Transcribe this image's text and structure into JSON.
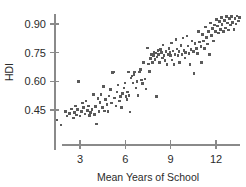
{
  "chart_data": {
    "type": "scatter",
    "title": "",
    "xlabel": "Mean Years of School",
    "ylabel": "HDI",
    "xlim": [
      1.1,
      13.6
    ],
    "ylim": [
      0.345,
      0.975
    ],
    "grid": false,
    "legend": null,
    "xticks": [
      3,
      6,
      9,
      12
    ],
    "xtick_labels": [
      "3",
      "6",
      "9",
      "12"
    ],
    "yticks": [
      0.45,
      0.6,
      0.75,
      0.9
    ],
    "ytick_labels": [
      "0.45",
      "0.60",
      "0.75",
      "0.90"
    ],
    "marker": {
      "shape": "square",
      "size_px": 2.6,
      "color": "#5a5a5a"
    },
    "series": [
      {
        "name": "countries",
        "n_points": 168,
        "points": [
          [
            1.45,
            0.398
          ],
          [
            1.75,
            0.372
          ],
          [
            2.05,
            0.443
          ],
          [
            2.15,
            0.418
          ],
          [
            2.3,
            0.432
          ],
          [
            2.45,
            0.455
          ],
          [
            2.55,
            0.408
          ],
          [
            2.62,
            0.438
          ],
          [
            2.7,
            0.47
          ],
          [
            2.78,
            0.424
          ],
          [
            2.85,
            0.452
          ],
          [
            2.92,
            0.6
          ],
          [
            3.0,
            0.418
          ],
          [
            3.1,
            0.441
          ],
          [
            3.18,
            0.486
          ],
          [
            3.25,
            0.462
          ],
          [
            3.32,
            0.43
          ],
          [
            3.4,
            0.497
          ],
          [
            3.48,
            0.448
          ],
          [
            3.55,
            0.47
          ],
          [
            3.62,
            0.422
          ],
          [
            3.7,
            0.437
          ],
          [
            3.8,
            0.452
          ],
          [
            3.88,
            0.53
          ],
          [
            3.95,
            0.425
          ],
          [
            4.02,
            0.468
          ],
          [
            4.1,
            0.376
          ],
          [
            4.18,
            0.51
          ],
          [
            4.25,
            0.443
          ],
          [
            4.32,
            0.489
          ],
          [
            4.4,
            0.53
          ],
          [
            4.48,
            0.462
          ],
          [
            4.55,
            0.572
          ],
          [
            4.62,
            0.445
          ],
          [
            4.7,
            0.505
          ],
          [
            4.78,
            0.478
          ],
          [
            4.85,
            0.441
          ],
          [
            4.92,
            0.523
          ],
          [
            5.0,
            0.556
          ],
          [
            5.08,
            0.487
          ],
          [
            5.15,
            0.645
          ],
          [
            5.22,
            0.648
          ],
          [
            5.3,
            0.512
          ],
          [
            5.38,
            0.47
          ],
          [
            5.45,
            0.545
          ],
          [
            5.52,
            0.58
          ],
          [
            5.6,
            0.497
          ],
          [
            5.68,
            0.521
          ],
          [
            5.75,
            0.462
          ],
          [
            5.82,
            0.535
          ],
          [
            5.9,
            0.566
          ],
          [
            5.98,
            0.592
          ],
          [
            6.05,
            0.52
          ],
          [
            6.1,
            0.505
          ],
          [
            6.15,
            0.545
          ],
          [
            6.2,
            0.648
          ],
          [
            6.25,
            0.527
          ],
          [
            6.3,
            0.44
          ],
          [
            6.38,
            0.618
          ],
          [
            6.45,
            0.628
          ],
          [
            6.52,
            0.592
          ],
          [
            6.58,
            0.636
          ],
          [
            6.62,
            0.648
          ],
          [
            6.7,
            0.565
          ],
          [
            6.78,
            0.6
          ],
          [
            6.85,
            0.525
          ],
          [
            6.92,
            0.648
          ],
          [
            7.0,
            0.662
          ],
          [
            7.08,
            0.608
          ],
          [
            7.15,
            0.588
          ],
          [
            7.22,
            0.7
          ],
          [
            7.3,
            0.612
          ],
          [
            7.38,
            0.56
          ],
          [
            7.45,
            0.775
          ],
          [
            7.52,
            0.69
          ],
          [
            7.58,
            0.652
          ],
          [
            7.65,
            0.718
          ],
          [
            7.72,
            0.742
          ],
          [
            7.8,
            0.7
          ],
          [
            7.85,
            0.735
          ],
          [
            7.9,
            0.752
          ],
          [
            7.95,
            0.715
          ],
          [
            8.0,
            0.748
          ],
          [
            8.05,
            0.52
          ],
          [
            8.1,
            0.728
          ],
          [
            8.15,
            0.76
          ],
          [
            8.2,
            0.742
          ],
          [
            8.25,
            0.7
          ],
          [
            8.32,
            0.768
          ],
          [
            8.38,
            0.752
          ],
          [
            8.45,
            0.722
          ],
          [
            8.5,
            0.79
          ],
          [
            8.55,
            0.735
          ],
          [
            8.62,
            0.71
          ],
          [
            8.68,
            0.755
          ],
          [
            8.75,
            0.688
          ],
          [
            8.82,
            0.742
          ],
          [
            8.88,
            0.772
          ],
          [
            8.95,
            0.752
          ],
          [
            9.0,
            0.735
          ],
          [
            9.05,
            0.8
          ],
          [
            9.1,
            0.712
          ],
          [
            9.15,
            0.758
          ],
          [
            9.22,
            0.688
          ],
          [
            9.28,
            0.742
          ],
          [
            9.35,
            0.82
          ],
          [
            9.42,
            0.77
          ],
          [
            9.48,
            0.735
          ],
          [
            9.55,
            0.755
          ],
          [
            9.6,
            0.7
          ],
          [
            9.68,
            0.788
          ],
          [
            9.75,
            0.742
          ],
          [
            9.82,
            0.826
          ],
          [
            9.88,
            0.762
          ],
          [
            9.95,
            0.722
          ],
          [
            10.0,
            0.752
          ],
          [
            10.08,
            0.838
          ],
          [
            10.15,
            0.785
          ],
          [
            10.22,
            0.745
          ],
          [
            10.28,
            0.688
          ],
          [
            10.35,
            0.768
          ],
          [
            10.42,
            0.812
          ],
          [
            10.5,
            0.755
          ],
          [
            10.55,
            0.642
          ],
          [
            10.62,
            0.798
          ],
          [
            10.7,
            0.772
          ],
          [
            10.78,
            0.745
          ],
          [
            10.85,
            0.86
          ],
          [
            10.92,
            0.805
          ],
          [
            11.0,
            0.782
          ],
          [
            11.05,
            0.7
          ],
          [
            11.12,
            0.845
          ],
          [
            11.18,
            0.812
          ],
          [
            11.25,
            0.772
          ],
          [
            11.32,
            0.885
          ],
          [
            11.38,
            0.83
          ],
          [
            11.45,
            0.795
          ],
          [
            11.52,
            0.862
          ],
          [
            11.58,
            0.742
          ],
          [
            11.65,
            0.905
          ],
          [
            11.72,
            0.84
          ],
          [
            11.78,
            0.878
          ],
          [
            11.85,
            0.812
          ],
          [
            11.92,
            0.895
          ],
          [
            11.98,
            0.862
          ],
          [
            12.05,
            0.925
          ],
          [
            12.1,
            0.89
          ],
          [
            12.15,
            0.852
          ],
          [
            12.22,
            0.912
          ],
          [
            12.28,
            0.872
          ],
          [
            12.35,
            0.935
          ],
          [
            12.4,
            0.898
          ],
          [
            12.48,
            0.862
          ],
          [
            12.55,
            0.918
          ],
          [
            12.62,
            0.88
          ],
          [
            12.68,
            0.94
          ],
          [
            12.75,
            0.905
          ],
          [
            12.82,
            0.868
          ],
          [
            12.88,
            0.928
          ],
          [
            12.95,
            0.895
          ],
          [
            13.02,
            0.938
          ],
          [
            13.1,
            0.908
          ],
          [
            13.18,
            0.872
          ],
          [
            13.25,
            0.93
          ],
          [
            13.32,
            0.9
          ],
          [
            13.4,
            0.942
          ],
          [
            13.48,
            0.915
          ],
          [
            13.55,
            0.935
          ]
        ]
      }
    ]
  }
}
